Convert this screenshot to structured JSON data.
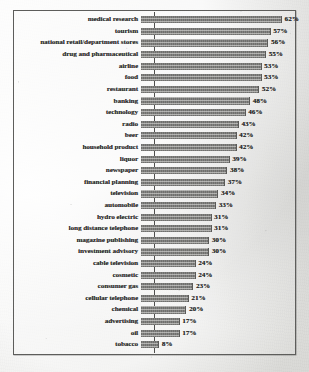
{
  "chart_data": {
    "type": "bar",
    "orientation": "horizontal",
    "title": "",
    "subtitle": "",
    "xlabel": "",
    "ylabel": "",
    "grid": false,
    "legend": null,
    "legend_position": "none",
    "xlim": [
      0,
      62
    ],
    "value_suffix": "%",
    "bar_color": "#7b7b79",
    "frame_color": "#5d5d5b",
    "background_color": "#e9e9e7",
    "categories": [
      "medical research",
      "tourism",
      "national retail/department stores",
      "drug and pharmaceutical",
      "airline",
      "food",
      "restaurant",
      "banking",
      "technology",
      "radio",
      "beer",
      "household product",
      "liquor",
      "newspaper",
      "financial planning",
      "television",
      "automobile",
      "hydro electric",
      "long distance telephone",
      "magazine publishing",
      "investment advisory",
      "cable television",
      "cosmetic",
      "consumer gas",
      "cellular telephone",
      "chemical",
      "advertising",
      "oil",
      "tobacco"
    ],
    "values": [
      62,
      57,
      56,
      55,
      53,
      53,
      52,
      48,
      46,
      43,
      42,
      42,
      39,
      38,
      37,
      34,
      33,
      31,
      31,
      30,
      30,
      24,
      24,
      23,
      21,
      20,
      17,
      17,
      8
    ],
    "value_labels": [
      "62%",
      "57%",
      "56%",
      "55%",
      "53%",
      "53%",
      "52%",
      "48%",
      "46%",
      "43%",
      "42%",
      "42%",
      "39%",
      "38%",
      "37%",
      "34%",
      "33%",
      "31%",
      "31%",
      "30%",
      "30%",
      "24%",
      "24%",
      "23%",
      "21%",
      "20%",
      "17%",
      "17%",
      "8%"
    ]
  }
}
